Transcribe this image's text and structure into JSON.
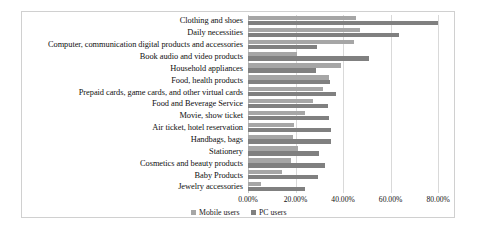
{
  "chart_data": {
    "type": "bar",
    "orientation": "horizontal",
    "title": "",
    "xlabel": "",
    "ylabel": "",
    "xlim": [
      0,
      85
    ],
    "xticks": [
      "0.00%",
      "20.00%",
      "40.00%",
      "60.00%",
      "80.00%"
    ],
    "xtick_values": [
      0,
      20,
      40,
      60,
      80
    ],
    "grid": true,
    "legend_position": "bottom",
    "categories": [
      "Clothing and shoes",
      "Daily necessities",
      "Computer, communication digital products and accessories",
      "Book audio and video products",
      "Household appliances",
      "Food, health products",
      "Prepaid cards, game cards, and other virtual cards",
      "Food and Beverage Service",
      "Movie, show ticket",
      "Air ticket, hotel reservation",
      "Handbags, bags",
      "Stationery",
      "Cosmetics and beauty products",
      "Baby Products",
      "Jewelry accessories"
    ],
    "series": [
      {
        "name": "Mobile users",
        "color": "#a6a6a6",
        "values": [
          45.5,
          47.0,
          44.5,
          20.5,
          39.0,
          34.0,
          31.5,
          27.5,
          24.0,
          19.5,
          19.0,
          21.0,
          18.0,
          14.5,
          5.5
        ]
      },
      {
        "name": "PC users",
        "color": "#808080",
        "values": [
          80.0,
          63.5,
          29.0,
          51.0,
          28.5,
          34.5,
          37.0,
          33.5,
          34.0,
          35.0,
          35.0,
          30.0,
          32.5,
          29.5,
          24.0
        ]
      }
    ]
  },
  "legend": {
    "items": [
      {
        "label": "Mobile users",
        "swatch": "mobile-swatch"
      },
      {
        "label": "PC users",
        "swatch": "pc-swatch"
      }
    ]
  }
}
